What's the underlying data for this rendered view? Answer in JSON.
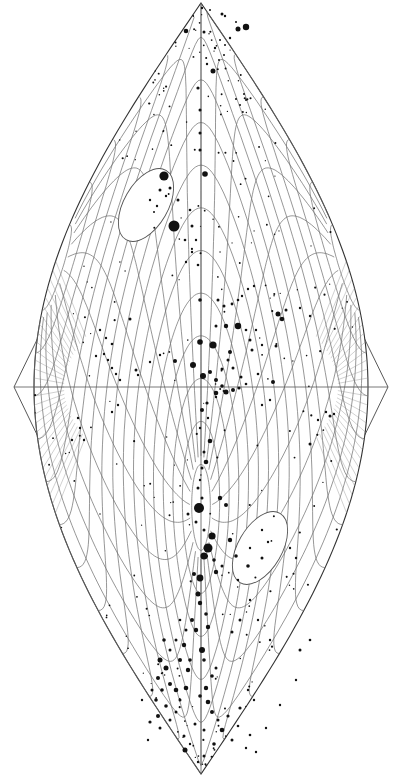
{
  "figure": {
    "type": "sky-map",
    "projection": "sinusoidal",
    "background": "#ffffff",
    "ink": "#111111",
    "grid_color": "#6a6a6a",
    "equator_y": 387,
    "center_x": 201,
    "top_y": 3,
    "bottom_y": 774,
    "outer_left_x": 14,
    "outer_right_x": 388,
    "inner_half_width": 167,
    "poles": [
      {
        "name": "north-pole-region",
        "cx": 146,
        "cy": 205,
        "rx": 22,
        "ry": 40,
        "rot": 30
      },
      {
        "name": "south-pole-region",
        "cx": 260,
        "cy": 548,
        "rx": 22,
        "ry": 40,
        "rot": 30
      }
    ],
    "stars": [
      [
        202,
        8,
        1.2
      ],
      [
        210,
        10,
        1
      ],
      [
        222,
        14,
        1.5
      ],
      [
        225,
        16,
        1.2
      ],
      [
        236,
        22,
        1
      ],
      [
        246,
        27,
        3.2
      ],
      [
        186,
        31,
        2.3
      ],
      [
        204,
        32,
        1.5
      ],
      [
        238,
        29,
        2.5
      ],
      [
        230,
        38,
        1.2
      ],
      [
        215,
        48,
        1.2
      ],
      [
        213,
        71,
        2.5
      ],
      [
        198,
        88,
        1.6
      ],
      [
        207,
        64,
        1.2
      ],
      [
        200,
        110,
        1.5
      ],
      [
        236,
        99,
        1
      ],
      [
        240,
        105,
        1
      ],
      [
        246,
        100,
        1
      ],
      [
        244,
        94,
        1
      ],
      [
        220,
        40,
        1
      ],
      [
        225,
        45,
        1
      ],
      [
        219,
        60,
        1
      ],
      [
        224,
        55,
        1
      ],
      [
        164,
        176,
        4.6
      ],
      [
        205,
        174,
        2.8
      ],
      [
        174,
        226,
        5.5
      ],
      [
        192,
        226,
        1.5
      ],
      [
        160,
        190,
        1.5
      ],
      [
        157,
        206,
        1.2
      ],
      [
        150,
        200,
        1.2
      ],
      [
        154,
        212,
        1
      ],
      [
        166,
        196,
        1.2
      ],
      [
        178,
        200,
        1.5
      ],
      [
        170,
        188,
        1.5
      ],
      [
        190,
        210,
        1.3
      ],
      [
        185,
        240,
        1.3
      ],
      [
        196,
        240,
        1.2
      ],
      [
        192,
        252,
        1.2
      ],
      [
        186,
        262,
        1.2
      ],
      [
        200,
        150,
        1.5
      ],
      [
        200,
        133,
        1.5
      ],
      [
        198,
        265,
        1.3
      ],
      [
        200,
        300,
        1.8
      ],
      [
        218,
        300,
        1.5
      ],
      [
        224,
        306,
        1.5
      ],
      [
        232,
        304,
        1.4
      ],
      [
        238,
        300,
        1.3
      ],
      [
        242,
        296,
        1.2
      ],
      [
        248,
        289,
        1.2
      ],
      [
        254,
        286,
        1.2
      ],
      [
        278,
        314,
        2.5
      ],
      [
        282,
        319,
        2.3
      ],
      [
        286,
        310,
        1.5
      ],
      [
        300,
        308,
        1.2
      ],
      [
        310,
        316,
        1.2
      ],
      [
        200,
        342,
        2.8
      ],
      [
        213,
        345,
        3.6
      ],
      [
        230,
        352,
        2
      ],
      [
        238,
        326,
        3.2
      ],
      [
        226,
        326,
        2.2
      ],
      [
        216,
        326,
        1.5
      ],
      [
        250,
        340,
        1.5
      ],
      [
        252,
        350,
        1.5
      ],
      [
        262,
        345,
        1.2
      ],
      [
        276,
        346,
        1.5
      ],
      [
        246,
        330,
        1.3
      ],
      [
        256,
        330,
        1.2
      ],
      [
        175,
        361,
        2
      ],
      [
        193,
        365,
        3
      ],
      [
        203,
        376,
        3
      ],
      [
        210,
        372,
        2
      ],
      [
        216,
        380,
        2
      ],
      [
        222,
        386,
        1.8
      ],
      [
        226,
        392,
        2.5
      ],
      [
        233,
        390,
        2
      ],
      [
        239,
        388,
        1.6
      ],
      [
        216,
        393,
        2.3
      ],
      [
        222,
        369,
        1.5
      ],
      [
        228,
        360,
        1.5
      ],
      [
        233,
        368,
        1.5
      ],
      [
        241,
        377,
        1.5
      ],
      [
        273,
        382,
        2
      ],
      [
        258,
        374,
        1.3
      ],
      [
        246,
        384,
        1.3
      ],
      [
        216,
        397,
        1.2
      ],
      [
        207,
        403,
        1.6
      ],
      [
        202,
        410,
        2
      ],
      [
        208,
        418,
        1.2
      ],
      [
        200,
        428,
        1.2
      ],
      [
        210,
        441,
        2.3
      ],
      [
        206,
        462,
        2.3
      ],
      [
        202,
        468,
        1.5
      ],
      [
        204,
        452,
        1.5
      ],
      [
        200,
        480,
        1.2
      ],
      [
        130,
        319,
        1.5
      ],
      [
        112,
        344,
        1.3
      ],
      [
        104,
        354,
        1.2
      ],
      [
        96,
        356,
        1.2
      ],
      [
        108,
        360,
        1.2
      ],
      [
        112,
        368,
        1.2
      ],
      [
        116,
        374,
        1.2
      ],
      [
        120,
        380,
        1.2
      ],
      [
        100,
        330,
        1.2
      ],
      [
        106,
        338,
        1.2
      ],
      [
        136,
        370,
        1.5
      ],
      [
        138,
        375,
        1.2
      ],
      [
        150,
        362,
        1.2
      ],
      [
        160,
        355,
        1.2
      ],
      [
        78,
        418,
        1.2
      ],
      [
        80,
        428,
        1.2
      ],
      [
        72,
        440,
        1.2
      ],
      [
        84,
        440,
        1.2
      ],
      [
        118,
        405,
        1.2
      ],
      [
        112,
        412,
        1.2
      ],
      [
        330,
        416,
        1.5
      ],
      [
        326,
        412,
        1.2
      ],
      [
        318,
        420,
        1.2
      ],
      [
        334,
        414,
        1.2
      ],
      [
        310,
        444,
        1.5
      ],
      [
        262,
        405,
        1.2
      ],
      [
        270,
        400,
        1.2
      ],
      [
        199,
        508,
        5
      ],
      [
        212,
        536,
        3.6
      ],
      [
        208,
        548,
        4.5
      ],
      [
        204,
        556,
        3.6
      ],
      [
        216,
        572,
        2.2
      ],
      [
        200,
        578,
        3.4
      ],
      [
        194,
        574,
        2
      ],
      [
        198,
        594,
        2.5
      ],
      [
        214,
        560,
        1.8
      ],
      [
        222,
        566,
        1.5
      ],
      [
        236,
        556,
        1.8
      ],
      [
        230,
        540,
        2.2
      ],
      [
        204,
        530,
        1.5
      ],
      [
        196,
        522,
        1.5
      ],
      [
        188,
        514,
        1.5
      ],
      [
        226,
        505,
        2
      ],
      [
        220,
        498,
        2.2
      ],
      [
        198,
        488,
        1.5
      ],
      [
        202,
        498,
        1.5
      ],
      [
        238,
        580,
        1.2
      ],
      [
        248,
        566,
        1.8
      ],
      [
        250,
        548,
        1.2
      ],
      [
        262,
        530,
        1.2
      ],
      [
        262,
        558,
        1.5
      ],
      [
        268,
        542,
        1.2
      ],
      [
        290,
        548,
        1.2
      ],
      [
        296,
        558,
        1.2
      ],
      [
        200,
        603,
        2.2
      ],
      [
        206,
        614,
        1.8
      ],
      [
        192,
        620,
        2
      ],
      [
        196,
        630,
        2.2
      ],
      [
        208,
        627,
        2.2
      ],
      [
        184,
        645,
        2.2
      ],
      [
        202,
        650,
        3
      ],
      [
        190,
        660,
        1.8
      ],
      [
        180,
        660,
        2
      ],
      [
        188,
        670,
        2.2
      ],
      [
        186,
        688,
        2.3
      ],
      [
        204,
        660,
        1.8
      ],
      [
        212,
        676,
        1.8
      ],
      [
        206,
        688,
        2.2
      ],
      [
        216,
        668,
        1.5
      ],
      [
        200,
        696,
        1.8
      ],
      [
        208,
        702,
        2.3
      ],
      [
        212,
        712,
        2
      ],
      [
        218,
        720,
        1.5
      ],
      [
        222,
        730,
        2.3
      ],
      [
        232,
        740,
        1.5
      ],
      [
        228,
        716,
        1.6
      ],
      [
        240,
        708,
        1.6
      ],
      [
        238,
        726,
        1.3
      ],
      [
        250,
        735,
        1.3
      ],
      [
        195,
        724,
        1.5
      ],
      [
        204,
        730,
        1.5
      ],
      [
        214,
        744,
        1.8
      ],
      [
        204,
        756,
        1.5
      ],
      [
        198,
        762,
        1.2
      ],
      [
        185,
        750,
        2.5
      ],
      [
        164,
        640,
        1.8
      ],
      [
        160,
        660,
        2.5
      ],
      [
        166,
        668,
        2.5
      ],
      [
        158,
        678,
        2
      ],
      [
        170,
        684,
        2
      ],
      [
        176,
        690,
        2.3
      ],
      [
        162,
        690,
        1.8
      ],
      [
        156,
        700,
        1.8
      ],
      [
        166,
        706,
        1.8
      ],
      [
        158,
        716,
        2
      ],
      [
        150,
        722,
        1.6
      ],
      [
        160,
        728,
        1.5
      ],
      [
        170,
        720,
        1.5
      ],
      [
        176,
        712,
        1.5
      ],
      [
        180,
        700,
        1.5
      ],
      [
        152,
        690,
        1.5
      ],
      [
        170,
        650,
        1.5
      ],
      [
        176,
        640,
        1.5
      ],
      [
        186,
        630,
        1.5
      ],
      [
        180,
        620,
        1.3
      ],
      [
        142,
        700,
        1.2
      ],
      [
        148,
        740,
        1.2
      ],
      [
        184,
        736,
        1.5
      ],
      [
        190,
        744,
        1.2
      ],
      [
        246,
        748,
        1.2
      ],
      [
        256,
        752,
        1.2
      ],
      [
        254,
        700,
        1.2
      ],
      [
        266,
        728,
        1.2
      ],
      [
        248,
        690,
        1.2
      ],
      [
        280,
        705,
        1.2
      ],
      [
        300,
        650,
        1.5
      ],
      [
        310,
        640,
        1.3
      ],
      [
        296,
        680,
        1.2
      ],
      [
        270,
        640,
        1.2
      ],
      [
        258,
        620,
        1.2
      ],
      [
        250,
        600,
        1.2
      ],
      [
        240,
        620,
        1.5
      ],
      [
        232,
        632,
        1.5
      ]
    ]
  }
}
